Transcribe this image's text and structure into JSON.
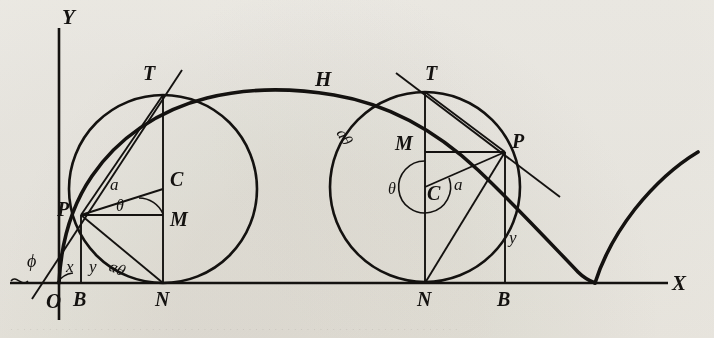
{
  "figure": {
    "background_color": "#f6f5f2",
    "ink_color": "#141210",
    "axes": {
      "x_label": "X",
      "y_label": "Y",
      "origin_label": "O",
      "x_axis_y": 283,
      "y_axis_x": 59,
      "x_axis_start": 10,
      "x_axis_end": 668,
      "y_axis_top": 28
    },
    "angle_labels": {
      "phi": "ϕ",
      "theta": "θ",
      "radius": "a",
      "arc": "aθ",
      "abscissa": "x",
      "ordinate": "y"
    },
    "curve_label": "H",
    "circles": [
      {
        "id": "left-circle",
        "cx": 163,
        "cy": 189,
        "r": 94,
        "center_label": "C",
        "top_label": "T",
        "foot_label": "N",
        "point_label": "P",
        "mid_label": "M",
        "base_label": "B",
        "px": 81,
        "py": 215,
        "bx": 81,
        "labels": [
          "T",
          "C",
          "M",
          "P",
          "N",
          "B",
          "a",
          "θ",
          "aθ",
          "x",
          "y"
        ]
      },
      {
        "id": "right-circle",
        "cx": 425,
        "cy": 187,
        "r": 95,
        "center_label": "C",
        "top_label": "T",
        "foot_label": "N",
        "point_label": "P",
        "mid_label": "M",
        "base_label": "B",
        "px": 505,
        "py": 152,
        "bx": 505,
        "labels": [
          "T",
          "C",
          "M",
          "P",
          "N",
          "B",
          "a",
          "θ",
          "aθ",
          "y"
        ]
      }
    ],
    "cycloid": {
      "cusp_left_x": 59,
      "cusp_right_x": 595,
      "peak_x": 300,
      "peak_y": 92,
      "radius": 95,
      "baseline_y": 283,
      "tail_end_x": 700,
      "tail_end_y": 155
    },
    "ghost_text": "· · · · · · · · · · · · · · · · · · · · · · · · · · · · · · · · · · · · · · · · · · · · · · · · · · · · · · · · · · · · · · · · · · · · · ·"
  }
}
